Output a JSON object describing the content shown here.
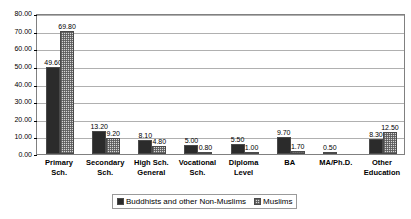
{
  "chart_data": {
    "type": "bar",
    "title": "",
    "xlabel": "",
    "ylabel": "",
    "ylim": [
      0,
      80
    ],
    "ytick_step": 10,
    "grid": true,
    "legend_position": "bottom",
    "categories": [
      "Primary Sch.",
      "Secondary Sch.",
      "High Sch. General",
      "Vocational Sch.",
      "Diploma Level",
      "BA",
      "MA/Ph.D.",
      "Other Education"
    ],
    "category_lines": [
      [
        "Primary",
        "Sch."
      ],
      [
        "Secondary",
        "Sch."
      ],
      [
        "High Sch.",
        "General"
      ],
      [
        "Vocational",
        "Sch."
      ],
      [
        "Diploma",
        "Level"
      ],
      [
        "BA",
        ""
      ],
      [
        "MA/Ph.D.",
        ""
      ],
      [
        "Other",
        "Education"
      ]
    ],
    "ytick_labels": [
      "0.00",
      "10.00",
      "20.00",
      "30.00",
      "40.00",
      "50.00",
      "60.00",
      "70.00",
      "80.00"
    ],
    "series": [
      {
        "name": "Buddhists and other Non-Muslims",
        "color": "#2b2b2b",
        "values": [
          49.6,
          13.2,
          8.1,
          5.0,
          5.5,
          9.7,
          0.5,
          8.3
        ],
        "labels": [
          "49.60",
          "13.20",
          "8.10",
          "5.00",
          "5.50",
          "9.70",
          "0.50",
          "8.30"
        ]
      },
      {
        "name": "Muslims",
        "color": "#d6d6d6",
        "values": [
          69.8,
          9.2,
          4.8,
          0.8,
          1.0,
          1.7,
          null,
          12.5
        ],
        "labels": [
          "69.80",
          "9.20",
          "4.80",
          "0.80",
          "1.00",
          "1.70",
          "",
          "12.50"
        ]
      }
    ]
  },
  "legend": {
    "items": [
      {
        "label": "Buddhists and other Non-Muslims"
      },
      {
        "label": "Muslims"
      }
    ]
  }
}
